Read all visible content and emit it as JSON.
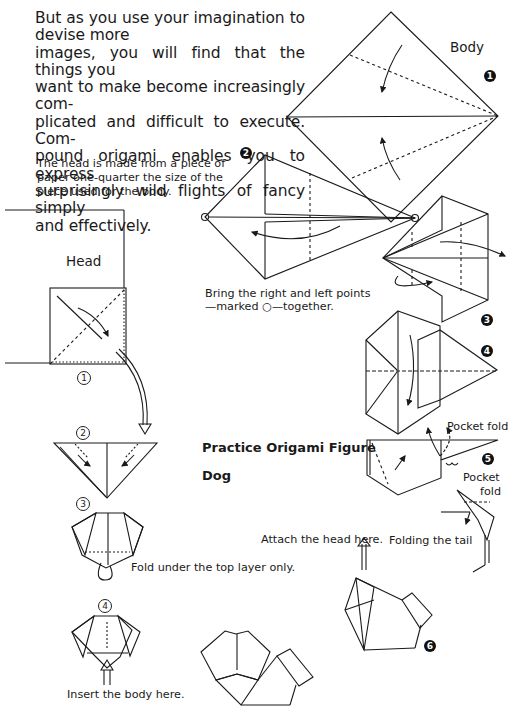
{
  "intro_paragraph": {
    "lines": [
      "But as you use your imagination to devise more",
      "images, you will find that the things you",
      "want to make become increasingly com-",
      "plicated and difficult to execute. Com-",
      "pound origami enables you to express",
      "surprisingly wild flights of fancy simply",
      "and effectively."
    ]
  },
  "head_note": {
    "lines": [
      "The head is made from a piece of",
      "paper one-quarter the size of the",
      "piece used for the body."
    ]
  },
  "section_labels": {
    "body": "Body",
    "head": "Head"
  },
  "figure_title": {
    "line1": "Practice Origami Figure",
    "line2": "Dog"
  },
  "instructions": {
    "bring_points_line1": "Bring the right and left points",
    "bring_points_line2": "—marked ○—together.",
    "pocket_fold_1": "Pocket fold",
    "pocket_fold_2_line1": "Pocket",
    "pocket_fold_2_line2": "fold",
    "folding_tail": "Folding the tail",
    "attach_head": "Attach the head here.",
    "fold_under": "Fold under the top layer only.",
    "insert_body": "Insert the body here."
  },
  "body_steps": [
    "1",
    "2",
    "3",
    "4",
    "5",
    "6"
  ],
  "head_steps": [
    "1",
    "2",
    "3",
    "4"
  ],
  "colors": {
    "ink": "#1a1a1a",
    "paper": "#ffffff"
  }
}
